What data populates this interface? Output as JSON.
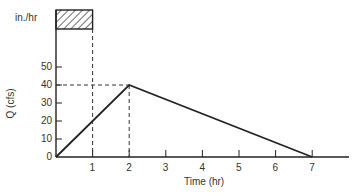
{
  "chart_data": {
    "type": "line",
    "title": "",
    "xlabel": "Time (hr)",
    "ylabel": "Q (cfs)",
    "hyetograph_label": "in./hr",
    "xlim": [
      0,
      7
    ],
    "ylim": [
      0,
      50
    ],
    "x_ticks": [
      1,
      2,
      3,
      4,
      5,
      6,
      7
    ],
    "y_ticks": [
      0,
      10,
      20,
      30,
      40,
      50
    ],
    "series": [
      {
        "name": "Hydrograph",
        "x": [
          0,
          2,
          7
        ],
        "y": [
          0,
          40,
          0
        ]
      }
    ],
    "rainfall_block": {
      "start": 0,
      "end": 1,
      "pattern": "hatched"
    },
    "reference_lines": [
      {
        "type": "vertical",
        "x": 1,
        "style": "dashed"
      },
      {
        "type": "vertical",
        "x": 2,
        "y_max": 40,
        "style": "dashed"
      },
      {
        "type": "horizontal",
        "y": 40,
        "x_max": 2,
        "style": "dashed"
      }
    ],
    "grid": false,
    "legend": "none"
  },
  "labels": {
    "x_tick_labels": [
      "1",
      "2",
      "3",
      "4",
      "5",
      "6",
      "7"
    ],
    "y_tick_labels": [
      "0",
      "10",
      "20",
      "30",
      "40",
      "50"
    ]
  }
}
